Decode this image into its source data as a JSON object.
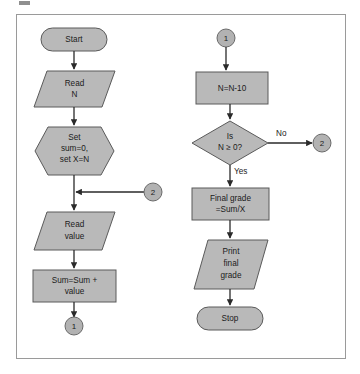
{
  "figure": {
    "frame": {
      "border_color": "#9a9a9a",
      "background_color": "#ffffff"
    },
    "palette": {
      "shape_fill": "#b9b9b9",
      "shape_stroke": "#5a5a5a",
      "connector_fill": "#b2b2b2",
      "connector_stroke": "#6a6a6a",
      "line_color": "#2a2a2a",
      "text_color": "#1b1b1b"
    }
  },
  "left_column": {
    "nodes": [
      {
        "id": "start",
        "type": "terminator",
        "label": "Start"
      },
      {
        "id": "read-n",
        "type": "input-output",
        "label_line1": "Read",
        "label_line2": "N"
      },
      {
        "id": "set-vars",
        "type": "preparation",
        "label_line1": "Set",
        "label_line2": "sum=0,",
        "label_line3": "set X=N"
      },
      {
        "id": "read-value",
        "type": "input-output",
        "label_line1": "Read",
        "label_line2": "value"
      },
      {
        "id": "sum-accum",
        "type": "process",
        "label_line1": "Sum=Sum +",
        "label_line2": "value"
      }
    ],
    "connectors": [
      {
        "id": "in-connector-2",
        "label": "2",
        "role": "entry-from-no-branch"
      },
      {
        "id": "out-connector-1",
        "label": "1",
        "role": "exit-to-right-column"
      }
    ]
  },
  "right_column": {
    "nodes": [
      {
        "id": "decrement-n",
        "type": "process",
        "label": "N=N-10"
      },
      {
        "id": "is-n-ge-0",
        "type": "decision",
        "label_line1": "Is",
        "label_line2": "N ≥ 0?"
      },
      {
        "id": "final-grade",
        "type": "process",
        "label_line1": "Final grade",
        "label_line2": "=Sum/X"
      },
      {
        "id": "print-grade",
        "type": "input-output",
        "label_line1": "Print",
        "label_line2": "final",
        "label_line3": "grade"
      },
      {
        "id": "stop",
        "type": "terminator",
        "label": "Stop"
      }
    ],
    "connectors": [
      {
        "id": "in-connector-1",
        "label": "1",
        "role": "entry-from-left-column"
      },
      {
        "id": "out-connector-2",
        "label": "2",
        "role": "exit-to-left-column"
      }
    ],
    "branch_labels": {
      "no": "No",
      "yes": "Yes"
    }
  }
}
